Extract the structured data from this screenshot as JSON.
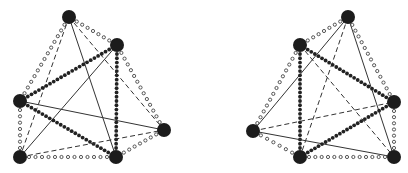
{
  "diagram": {
    "edge_styles": {
      "solid": {
        "stroke": "#333333",
        "width": 1
      },
      "dashed": {
        "stroke": "#333333",
        "width": 1,
        "dash": "5 3"
      },
      "filled_dots": {
        "fill": "#222222",
        "r": 1.9,
        "spacing": 4.2
      },
      "open_dots": {
        "stroke": "#444444",
        "r": 1.6,
        "spacing": 6.5
      }
    },
    "node_style": {
      "fill": "#1c1c1c",
      "r": 7
    },
    "graphs": [
      {
        "name": "left-graph",
        "nodes": [
          {
            "id": "A",
            "x": 69,
            "y": 17
          },
          {
            "id": "B",
            "x": 117,
            "y": 45
          },
          {
            "id": "C",
            "x": 20,
            "y": 101
          },
          {
            "id": "D",
            "x": 164,
            "y": 130
          },
          {
            "id": "E",
            "x": 20,
            "y": 157
          },
          {
            "id": "F",
            "x": 116,
            "y": 157
          }
        ],
        "edges": [
          {
            "from": "A",
            "to": "B",
            "style": "open_dots"
          },
          {
            "from": "A",
            "to": "C",
            "style": "open_dots"
          },
          {
            "from": "A",
            "to": "E",
            "style": "dashed"
          },
          {
            "from": "A",
            "to": "F",
            "style": "solid"
          },
          {
            "from": "A",
            "to": "D",
            "style": "dashed"
          },
          {
            "from": "B",
            "to": "C",
            "style": "filled_dots"
          },
          {
            "from": "B",
            "to": "F",
            "style": "filled_dots"
          },
          {
            "from": "B",
            "to": "D",
            "style": "open_dots"
          },
          {
            "from": "B",
            "to": "E",
            "style": "solid"
          },
          {
            "from": "C",
            "to": "E",
            "style": "open_dots"
          },
          {
            "from": "C",
            "to": "F",
            "style": "filled_dots"
          },
          {
            "from": "C",
            "to": "D",
            "style": "solid"
          },
          {
            "from": "E",
            "to": "F",
            "style": "open_dots"
          },
          {
            "from": "E",
            "to": "D",
            "style": "dashed"
          },
          {
            "from": "F",
            "to": "D",
            "style": "open_dots"
          }
        ]
      },
      {
        "name": "right-graph",
        "nodes": [
          {
            "id": "P",
            "x": 348,
            "y": 17
          },
          {
            "id": "Q",
            "x": 300,
            "y": 45
          },
          {
            "id": "R",
            "x": 253,
            "y": 131
          },
          {
            "id": "S",
            "x": 394,
            "y": 102
          },
          {
            "id": "T",
            "x": 300,
            "y": 157
          },
          {
            "id": "U",
            "x": 394,
            "y": 157
          }
        ],
        "edges": [
          {
            "from": "P",
            "to": "Q",
            "style": "open_dots"
          },
          {
            "from": "P",
            "to": "R",
            "style": "solid"
          },
          {
            "from": "P",
            "to": "T",
            "style": "dashed"
          },
          {
            "from": "P",
            "to": "U",
            "style": "solid"
          },
          {
            "from": "P",
            "to": "S",
            "style": "open_dots"
          },
          {
            "from": "Q",
            "to": "R",
            "style": "open_dots"
          },
          {
            "from": "Q",
            "to": "T",
            "style": "filled_dots"
          },
          {
            "from": "Q",
            "to": "S",
            "style": "filled_dots"
          },
          {
            "from": "Q",
            "to": "U",
            "style": "dashed"
          },
          {
            "from": "R",
            "to": "S",
            "style": "dashed"
          },
          {
            "from": "R",
            "to": "T",
            "style": "open_dots"
          },
          {
            "from": "R",
            "to": "U",
            "style": "solid"
          },
          {
            "from": "T",
            "to": "S",
            "style": "filled_dots"
          },
          {
            "from": "T",
            "to": "U",
            "style": "open_dots"
          },
          {
            "from": "S",
            "to": "U",
            "style": "open_dots"
          }
        ]
      }
    ]
  }
}
